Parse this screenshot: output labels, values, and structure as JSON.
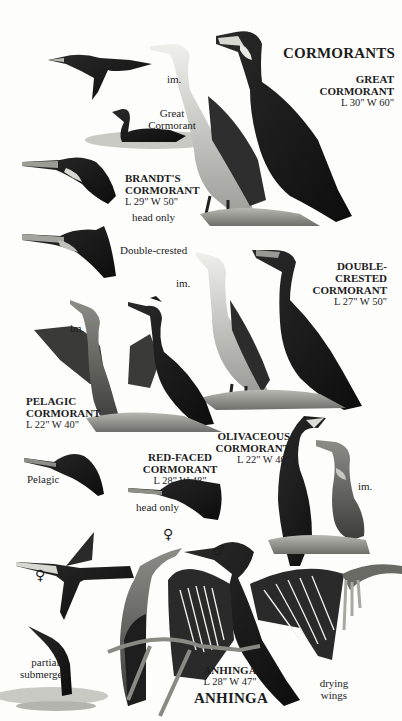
{
  "plate": {
    "section_title": "CORMORANTS",
    "footer_title": "ANHINGA",
    "background": "#fdfdfc",
    "ink": "#1c1c1c"
  },
  "species": [
    {
      "id": "great",
      "name_lines": [
        "GREAT",
        "CORMORANT"
      ],
      "measurements": "L 30\" W 60\""
    },
    {
      "id": "brandts",
      "name_lines": [
        "BRANDT'S",
        "CORMORANT"
      ],
      "measurements": "L 29\" W 50\"",
      "note": "head only"
    },
    {
      "id": "double-crested",
      "name_lines": [
        "DOUBLE-",
        "CRESTED",
        "CORMORANT"
      ],
      "measurements": "L 27\" W 50\""
    },
    {
      "id": "pelagic",
      "name_lines": [
        "PELAGIC",
        "CORMORANT"
      ],
      "measurements": "L 22\" W 40\""
    },
    {
      "id": "olivaceous",
      "name_lines": [
        "OLIVACEOUS",
        "CORMORANT"
      ],
      "measurements": "L 22\" W 40\""
    },
    {
      "id": "red-faced",
      "name_lines": [
        "RED-FACED CORMORANT"
      ],
      "measurements": "L 28\" W 48\"",
      "note": "head only"
    },
    {
      "id": "anhinga",
      "name_lines": [
        "ANHINGA"
      ],
      "measurements": "L 28\" W 47\""
    }
  ],
  "annotations": {
    "great_immature": "im.",
    "great_swimming": [
      "Great",
      "Cormorant"
    ],
    "double_crested_head": "Double-crested",
    "double_crested_immature": "im.",
    "pelagic_immature": "im.",
    "pelagic_head": "Pelagic",
    "olivaceous_immature": "im.",
    "anhinga_female_flight": "♀",
    "anhinga_female_perched": "♀",
    "anhinga_male": "♂",
    "anhinga_submerged": [
      "partially",
      "submerged"
    ],
    "anhinga_drying": [
      "drying",
      "wings"
    ]
  }
}
